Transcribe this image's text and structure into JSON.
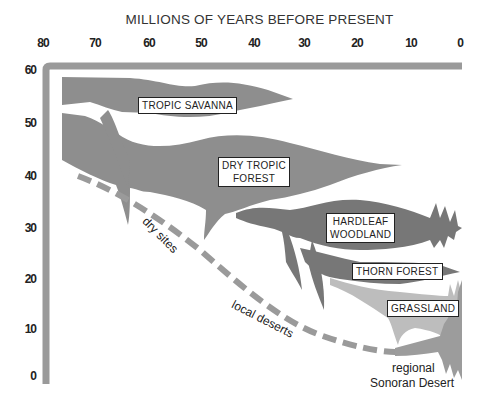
{
  "title": "MILLIONS OF YEARS BEFORE PRESENT",
  "x_ticks": [
    "80",
    "70",
    "60",
    "50",
    "40",
    "30",
    "20",
    "10",
    "0"
  ],
  "y_ticks": [
    "60",
    "50",
    "40",
    "30",
    "20",
    "10",
    "0"
  ],
  "colors": {
    "axis": "#9a9a9a",
    "main_band": "#8e8e8e",
    "hardleaf_band": "#777777",
    "grassland_band": "#bdbdbd",
    "desert_band": "#9c9c9c",
    "dashed_line": "#9a9a9a",
    "label_border": "#222222"
  },
  "labels": {
    "tropic_savanna": "TROPIC SAVANNA",
    "dry_tropic_forest_line1": "DRY TROPIC",
    "dry_tropic_forest_line2": "FOREST",
    "hardleaf_woodland_line1": "HARDLEAF",
    "hardleaf_woodland_line2": "WOODLAND",
    "thorn_forest": "THORN FOREST",
    "grassland": "GRASSLAND"
  },
  "annotations": {
    "dry_sites": "dry sites",
    "local_deserts": "local deserts",
    "regional_line1": "regional",
    "regional_line2": "Sonoran Desert"
  }
}
